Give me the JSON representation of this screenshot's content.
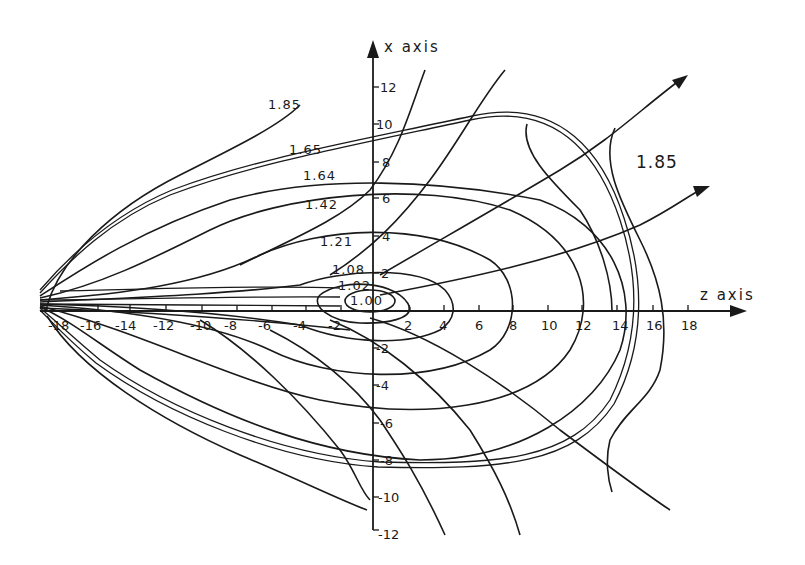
{
  "diagram": {
    "type": "contour plot with field lines",
    "axes": {
      "z_axis": {
        "title": "z axis",
        "ticks": [
          "-18",
          "-16",
          "-14",
          "-12",
          "-10",
          "-8",
          "-6",
          "-4",
          "-2",
          "2",
          "4",
          "6",
          "8",
          "10",
          "12",
          "14",
          "16",
          "18"
        ]
      },
      "x_axis": {
        "title": "x axis",
        "ticks": [
          "12",
          "10",
          "8",
          "6",
          "4",
          "2",
          "-2",
          "-4",
          "-6",
          "-8",
          "-10",
          "-12"
        ]
      }
    },
    "contour_labels": [
      {
        "id": "c100",
        "text": "1.00"
      },
      {
        "id": "c102",
        "text": "1.02"
      },
      {
        "id": "c108",
        "text": "1.08"
      },
      {
        "id": "c121",
        "text": "1.21"
      },
      {
        "id": "c142",
        "text": "1.42"
      },
      {
        "id": "c164",
        "text": "1.64"
      },
      {
        "id": "c165",
        "text": "1.65"
      },
      {
        "id": "c185_left",
        "text": "1.85"
      },
      {
        "id": "c185_right",
        "text": "1.85"
      }
    ],
    "field_lines": {
      "count_with_arrows": 3,
      "description": "Field lines emanate from the origin region, crossing the closed contours; two upper-right lines and the z-axis end in arrowheads."
    }
  }
}
